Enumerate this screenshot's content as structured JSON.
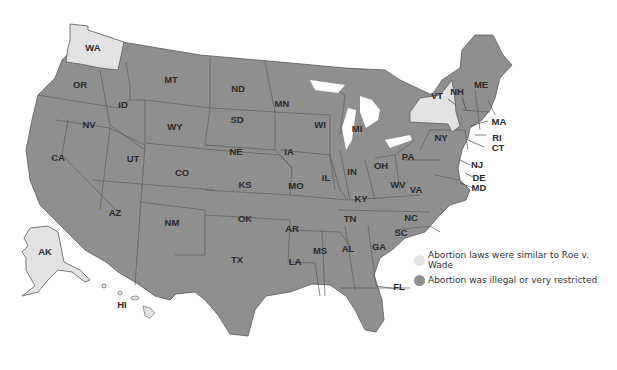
{
  "title_partial": "... by ... g ... y",
  "colors": {
    "legal": "#e3e3e3",
    "restricted": "#8f8f8f",
    "border": "#5a5a5a"
  },
  "legend": {
    "items": [
      {
        "label": "Abortion laws were similar to Roe v. Wade",
        "color": "#e3e3e3"
      },
      {
        "label": "Abortion was illegal or very restricted",
        "color": "#8f8f8f"
      }
    ]
  },
  "states": {
    "legal": [
      "WA",
      "NY",
      "AK",
      "HI"
    ],
    "restricted": [
      "OR",
      "CA",
      "NV",
      "ID",
      "MT",
      "WY",
      "UT",
      "AZ",
      "CO",
      "NM",
      "ND",
      "SD",
      "NE",
      "KS",
      "OK",
      "TX",
      "MN",
      "IA",
      "MO",
      "AR",
      "LA",
      "WI",
      "IL",
      "MS",
      "MI",
      "IN",
      "KY",
      "TN",
      "AL",
      "OH",
      "GA",
      "FL",
      "SC",
      "NC",
      "VA",
      "WV",
      "PA",
      "NJ",
      "DE",
      "MD",
      "CT",
      "RI",
      "MA",
      "VT",
      "NH",
      "ME"
    ]
  },
  "labels": {
    "WA": "WA",
    "OR": "OR",
    "CA": "CA",
    "NV": "NV",
    "ID": "ID",
    "MT": "MT",
    "WY": "WY",
    "UT": "UT",
    "AZ": "AZ",
    "CO": "CO",
    "NM": "NM",
    "ND": "ND",
    "SD": "SD",
    "NE": "NE",
    "KS": "KS",
    "OK": "OK",
    "TX": "TX",
    "MN": "MN",
    "IA": "IA",
    "MO": "MO",
    "AR": "AR",
    "LA": "LA",
    "WI": "WI",
    "IL": "IL",
    "MS": "MS",
    "MI": "MI",
    "IN": "IN",
    "KY": "KY",
    "TN": "TN",
    "AL": "AL",
    "OH": "OH",
    "GA": "GA",
    "FL": "FL",
    "SC": "SC",
    "NC": "NC",
    "VA": "VA",
    "WV": "WV",
    "PA": "PA",
    "NY": "NY",
    "NJ": "NJ",
    "DE": "DE",
    "MD": "MD",
    "CT": "CT",
    "RI": "RI",
    "MA": "MA",
    "VT": "VT",
    "NH": "NH",
    "ME": "ME",
    "AK": "AK",
    "HI": "HI"
  }
}
